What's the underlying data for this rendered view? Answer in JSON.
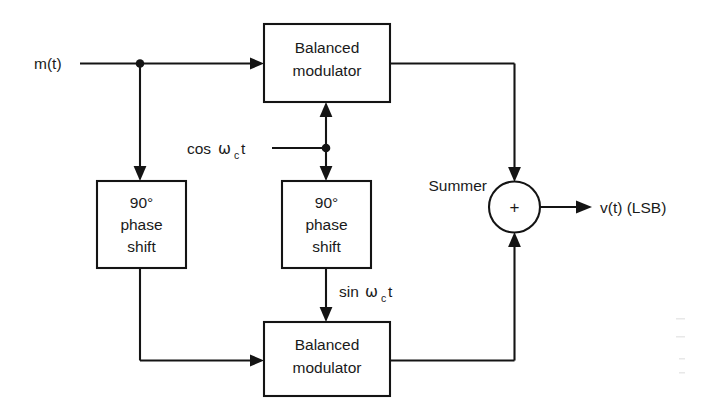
{
  "diagram": {
    "background_color": "#ffffff",
    "line_color": "#141414",
    "text_color": "#1a1a1a",
    "blocks": {
      "balanced_modulator_top": {
        "line1": "Balanced",
        "line2": "modulator"
      },
      "balanced_modulator_bottom": {
        "line1": "Balanced",
        "line2": "modulator"
      },
      "phase_shift_left": {
        "line1": "90°",
        "line2": "phase",
        "line3": "shift"
      },
      "phase_shift_middle": {
        "line1": "90°",
        "line2": "phase",
        "line3": "shift"
      },
      "summer": {
        "label": "Summer",
        "symbol": "+"
      }
    },
    "signals": {
      "input_message": "m(t)",
      "carrier_cos": {
        "prefix": "cos ",
        "omega": "ω",
        "subscript": "c",
        "suffix": "t",
        "full": "cos ωc t"
      },
      "carrier_sin": {
        "prefix": "sin ",
        "omega": "ω",
        "subscript": "c",
        "suffix": "t",
        "full": "sin ωc t"
      },
      "output": "v(t) (LSB)"
    }
  }
}
